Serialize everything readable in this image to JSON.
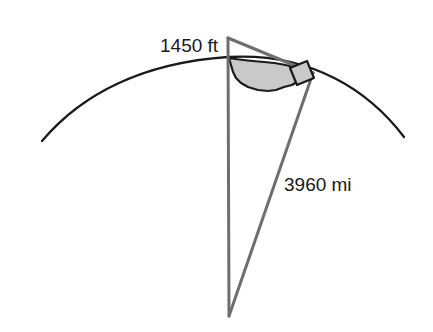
{
  "diagram": {
    "background_color": "#ffffff",
    "labels": {
      "height_label": "1450 ft",
      "radius_label": "3960 mi"
    },
    "colors": {
      "arc_stroke": "#1a1a1a",
      "radius_stroke": "#6e6e6e",
      "tangent_stroke": "#6e6e6e",
      "sector_fill": "#c9c9c9",
      "sector_stroke": "#1a1a1a",
      "text_fill": "#1a1a1a"
    },
    "elements": {
      "earth_arc_name": "earth-surface-arc",
      "vertical_radius_name": "vertical-radius-line",
      "slanted_radius_name": "slanted-radius-line",
      "tangent_name": "tangent-line",
      "angle_sector_name": "central-angle-sector",
      "right_angle_name": "right-angle-marker"
    },
    "geometry": {
      "apex_x": 228,
      "apex_y": 38,
      "center_x": 228,
      "center_y": 316,
      "tangent_point_x": 311,
      "tangent_point_y": 71,
      "arc_left_x": 42,
      "arc_left_y": 141,
      "arc_right_x": 404,
      "arc_right_y": 137,
      "surface_top_x": 228,
      "surface_top_y": 57
    },
    "annotations": {
      "height_label_x": 160,
      "height_label_y": 50,
      "radius_label_x": 284,
      "radius_label_y": 190
    }
  }
}
